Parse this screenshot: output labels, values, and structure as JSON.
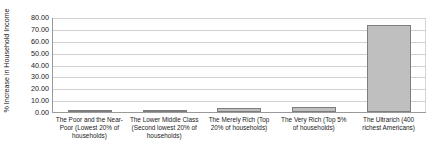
{
  "chart_data": {
    "type": "bar",
    "title": "",
    "xlabel": "",
    "ylabel": "% Increase in Household Income",
    "ylim": [
      0,
      80
    ],
    "ytick_step": 10,
    "ytick_labels": [
      "0.00",
      "10.00",
      "20.00",
      "30.00",
      "40.00",
      "50.00",
      "60.00",
      "70.00",
      "80.00"
    ],
    "yticks": [
      0,
      10,
      20,
      30,
      40,
      50,
      60,
      70,
      80
    ],
    "grid": true,
    "legend": "none",
    "categories": [
      "The Poor and the Near-Poor (Lowest 20% of households)",
      "The Lower Middle Class (Second lowest 20% of households)",
      "The Merely Rich (Top 20% of households)",
      "The Very Rich (Top 5% of households)",
      "The Ultrarich (400 richest Americans)"
    ],
    "values": [
      1.0,
      1.5,
      3.5,
      4.0,
      73.0
    ],
    "bar_fill_color": "#bfbfbf",
    "bar_border_color": "#7d7d7d",
    "gridline_color": "#d0d0d0",
    "axis_color": "#9a9a9a"
  }
}
